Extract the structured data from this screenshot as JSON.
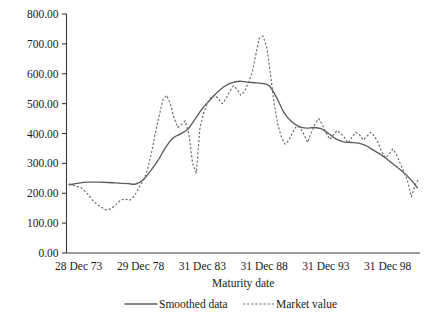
{
  "chart_data": {
    "type": "line",
    "title": "",
    "xlabel": "Maturity date",
    "ylabel": "",
    "grid": false,
    "legend_position": "bottom",
    "ylim": [
      0,
      800
    ],
    "ytick_labels": [
      "800.00",
      "700.00",
      "600.00",
      "500.00",
      "400.00",
      "300.00",
      "200.00",
      "100.00",
      "0.00"
    ],
    "ytick_values": [
      800,
      700,
      600,
      500,
      400,
      300,
      200,
      100,
      0
    ],
    "xtick_labels": [
      "28 Dec 73",
      "29 Dec 78",
      "31 Dec 83",
      "31 Dec 88",
      "31 Dec 93",
      "31 Dec 98"
    ],
    "xtick_values": [
      1973.99,
      1978.99,
      1983.99,
      1988.99,
      1993.99,
      1998.99
    ],
    "xlim": [
      1973.0,
      2001.6
    ],
    "legend": [
      {
        "name": "Smoothed data",
        "style": "solid"
      },
      {
        "name": "Market value",
        "style": "dashed"
      }
    ],
    "series": [
      {
        "name": "Smoothed data",
        "style": "solid",
        "x": [
          1973.2,
          1974.0,
          1974.8,
          1975.6,
          1976.4,
          1977.2,
          1978.0,
          1978.6,
          1979.2,
          1979.8,
          1980.4,
          1981.0,
          1981.6,
          1982.2,
          1982.8,
          1983.4,
          1984.0,
          1984.6,
          1985.2,
          1985.8,
          1986.4,
          1987.0,
          1987.6,
          1988.2,
          1988.8,
          1989.4,
          1990.0,
          1990.6,
          1991.2,
          1991.8,
          1992.4,
          1993.0,
          1993.6,
          1994.2,
          1994.8,
          1995.4,
          1996.0,
          1996.6,
          1997.2,
          1997.8,
          1998.4,
          1999.0,
          1999.6,
          2000.2,
          2000.8,
          2001.4
        ],
        "y": [
          228,
          234,
          237,
          237,
          236,
          234,
          232,
          231,
          245,
          275,
          310,
          352,
          384,
          398,
          414,
          448,
          484,
          512,
          538,
          558,
          570,
          575,
          572,
          570,
          568,
          560,
          520,
          470,
          440,
          424,
          418,
          420,
          416,
          400,
          382,
          372,
          370,
          368,
          360,
          345,
          330,
          312,
          292,
          272,
          248,
          218
        ]
      },
      {
        "name": "Market value",
        "style": "dashed",
        "x": [
          1973.2,
          1973.7,
          1974.2,
          1974.7,
          1975.2,
          1975.7,
          1976.2,
          1976.6,
          1977.0,
          1977.4,
          1977.8,
          1978.1,
          1978.4,
          1978.7,
          1979.0,
          1979.3,
          1979.6,
          1979.9,
          1980.2,
          1980.5,
          1980.8,
          1981.1,
          1981.4,
          1981.7,
          1982.0,
          1982.3,
          1982.6,
          1982.9,
          1983.2,
          1983.5,
          1983.8,
          1984.1,
          1984.4,
          1984.7,
          1985.0,
          1985.3,
          1985.6,
          1985.9,
          1986.2,
          1986.5,
          1986.8,
          1987.1,
          1987.4,
          1987.7,
          1988.0,
          1988.3,
          1988.6,
          1988.9,
          1989.2,
          1989.5,
          1989.8,
          1990.1,
          1990.4,
          1990.7,
          1991.0,
          1991.3,
          1991.6,
          1991.9,
          1992.2,
          1992.5,
          1992.8,
          1993.1,
          1993.4,
          1993.7,
          1994.0,
          1994.3,
          1994.6,
          1994.9,
          1995.2,
          1995.5,
          1995.8,
          1996.1,
          1996.4,
          1996.7,
          1997.0,
          1997.3,
          1997.6,
          1997.9,
          1998.2,
          1998.5,
          1998.8,
          1999.1,
          1999.4,
          1999.7,
          2000.0,
          2000.3,
          2000.6,
          2000.9,
          2001.2,
          2001.5
        ],
        "y": [
          232,
          224,
          218,
          198,
          172,
          156,
          144,
          148,
          162,
          178,
          180,
          176,
          186,
          206,
          228,
          250,
          286,
          340,
          404,
          460,
          512,
          528,
          500,
          452,
          420,
          430,
          442,
          400,
          300,
          268,
          420,
          470,
          500,
          522,
          528,
          516,
          500,
          516,
          540,
          560,
          548,
          528,
          540,
          570,
          600,
          660,
          720,
          726,
          690,
          600,
          500,
          430,
          386,
          364,
          378,
          404,
          424,
          420,
          398,
          370,
          402,
          432,
          450,
          430,
          402,
          380,
          396,
          410,
          400,
          386,
          368,
          388,
          404,
          396,
          378,
          390,
          404,
          392,
          370,
          340,
          318,
          330,
          348,
          330,
          300,
          272,
          240,
          188,
          228,
          248
        ]
      }
    ]
  },
  "axis": {
    "y_title": "",
    "x_title": "Maturity date"
  }
}
